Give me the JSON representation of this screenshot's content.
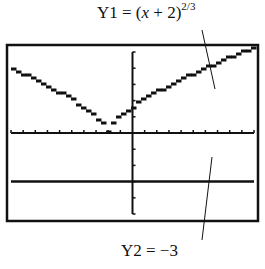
{
  "labels": {
    "y1": {
      "prefix": "Y1 = (",
      "var": "x",
      "mid": " + 2)",
      "exponent": "2/3"
    },
    "y2": {
      "text": "Y2 = −3"
    }
  },
  "chart_data": {
    "type": "line",
    "title": "",
    "xlabel": "",
    "ylabel": "",
    "xlim": [
      -10,
      10
    ],
    "ylim": [
      -5,
      5
    ],
    "grid": false,
    "x_tick_step": 1,
    "y_tick_step": 1,
    "series": [
      {
        "name": "Y1 = (x + 2)^(2/3)",
        "formula": "(x+2)^(2/3)",
        "style": "stepped-pixel"
      },
      {
        "name": "Y2 = -3",
        "formula": "-3",
        "style": "horizontal-line"
      }
    ]
  },
  "colors": {
    "ink": "#111111",
    "background": "#ffffff"
  }
}
